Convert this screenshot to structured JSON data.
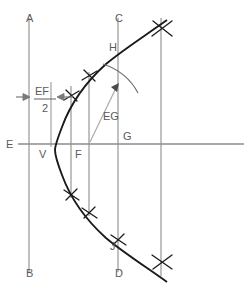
{
  "diagram": {
    "colors": {
      "curve": "#1a1a1a",
      "construction_line": "#8c8c8c",
      "axis": "#8c8c8c",
      "label_text": "#5a5a5a",
      "leader_line": "#a8a8a8",
      "background": "#ffffff"
    },
    "point_labels": [
      {
        "text": "A",
        "x": 26,
        "y": 22,
        "name": "label-a"
      },
      {
        "text": "B",
        "x": 26,
        "y": 277,
        "name": "label-b"
      },
      {
        "text": "C",
        "x": 115,
        "y": 22,
        "name": "label-c"
      },
      {
        "text": "D",
        "x": 115,
        "y": 277,
        "name": "label-d"
      },
      {
        "text": "E",
        "x": 9,
        "y": 148,
        "name": "label-e"
      },
      {
        "text": "V",
        "x": 39,
        "y": 158,
        "name": "label-v"
      },
      {
        "text": "F",
        "x": 76,
        "y": 158,
        "name": "label-f"
      },
      {
        "text": "G",
        "x": 124,
        "y": 140,
        "name": "label-g"
      },
      {
        "text": "H",
        "x": 110,
        "y": 50,
        "name": "label-h"
      },
      {
        "text": "J",
        "x": 110,
        "y": 248,
        "name": "label-j"
      }
    ],
    "dimension_labels": [
      {
        "id": "ef-half",
        "numerator": "EF",
        "denominator": "2",
        "name": "dimension-ef-over-2",
        "num_x": 41,
        "num_y": 93,
        "den_x": 46,
        "den_y": 109,
        "bar_x1": 34,
        "bar_x2": 56,
        "bar_y": 97
      }
    ],
    "leader_labels": [
      {
        "text": "EG",
        "x": 104,
        "y": 118,
        "name": "leader-label-eg"
      }
    ],
    "vertical_lines": [
      {
        "name": "line-ab",
        "x": 29,
        "y1": 18,
        "y2": 272
      },
      {
        "name": "line-ef-half-marker",
        "x": 51,
        "y1": 82,
        "y2": 147
      },
      {
        "name": "line-through-f",
        "x": 71,
        "y1": 86,
        "y2": 198
      },
      {
        "name": "line-ordinate-2",
        "x": 89,
        "y1": 72,
        "y2": 216
      },
      {
        "name": "line-cd",
        "x": 118,
        "y1": 18,
        "y2": 272
      },
      {
        "name": "line-ordinate-4",
        "x": 161,
        "y1": 18,
        "y2": 276
      }
    ],
    "horizontal_axis": {
      "name": "axis-eg",
      "x1": 18,
      "x2": 244,
      "y": 144
    },
    "curve": {
      "name": "parabola-curve",
      "path": "M 167 20 C 143 37 120 52 106 64 C 86 82 70 105 62 127 C 57 140 55 146 55 150 C 55 155 57 162 62 175 C 70 197 86 220 106 238 C 120 250 143 265 167 282"
    },
    "tick_crosses": [
      {
        "name": "tick-cross-top-right",
        "x": 162,
        "y": 28,
        "size": 9
      },
      {
        "name": "tick-cross-upper",
        "x": 89,
        "y": 75,
        "size": 7
      },
      {
        "name": "tick-cross-upper-inner",
        "x": 71,
        "y": 95,
        "size": 7
      },
      {
        "name": "tick-cross-lower-inner",
        "x": 71,
        "y": 195,
        "size": 7
      },
      {
        "name": "tick-cross-lower",
        "x": 89,
        "y": 213,
        "size": 7
      },
      {
        "name": "tick-cross-j",
        "x": 118,
        "y": 240,
        "size": 7
      },
      {
        "name": "tick-cross-bottom-right",
        "x": 162,
        "y": 262,
        "size": 9
      }
    ],
    "arrows": [
      {
        "name": "arrow-ef-half-left",
        "x1": 18,
        "y1": 97,
        "x2": 30,
        "y2": 97
      },
      {
        "name": "arrow-ef-half-right",
        "x1": 72,
        "y1": 97,
        "x2": 59,
        "y2": 97
      }
    ],
    "leader_arrow": {
      "name": "leader-arrow-eg",
      "path": "M 90 142 L 118 84",
      "tip_x": 118,
      "tip_y": 84
    },
    "tangent_arc": {
      "name": "tangent-arc-at-h",
      "path": "M 104 65 Q 126 72 137 92"
    }
  }
}
